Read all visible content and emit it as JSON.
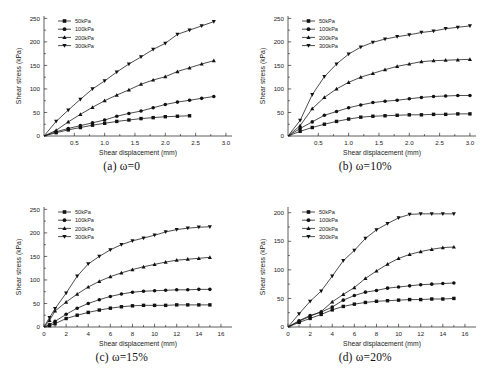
{
  "figure": {
    "background": "#ffffff",
    "series_color": "#111111",
    "panel_count": 4
  },
  "common": {
    "xlabel": "Shear displacement (mm)",
    "ylabel": "Shear stress (kPa)",
    "legend": [
      {
        "label": "50kPa",
        "marker": "square"
      },
      {
        "label": "100kPa",
        "marker": "circle"
      },
      {
        "label": "200kPa",
        "marker": "triangle-up"
      },
      {
        "label": "300kPa",
        "marker": "triangle-down"
      }
    ]
  },
  "captions": {
    "a": "(a) ω=0",
    "b": "(b) ω=10%",
    "c": "(c) ω=15%",
    "d": "(d) ω=20%"
  },
  "chart_data": [
    {
      "type": "line",
      "panel": "a",
      "title": "(a) ω=0",
      "xlabel": "Shear displacement (mm)",
      "ylabel": "Shear stress (kPa)",
      "xlim": [
        0,
        3.1
      ],
      "ylim": [
        0,
        255
      ],
      "xticks": [
        0.5,
        1.0,
        1.5,
        2.0,
        2.5,
        3.0
      ],
      "xticklabels": [
        "0.5",
        "1.0",
        "1.5",
        "2.0",
        "2.5",
        "3.0"
      ],
      "yticks": [
        0,
        50,
        100,
        150,
        200,
        250
      ],
      "yticklabels": [
        "0",
        "50",
        "100",
        "150",
        "200",
        "250"
      ],
      "grid": false,
      "legend_position": "top-left",
      "series": [
        {
          "name": "50kPa",
          "marker": "square",
          "x": [
            0,
            0.2,
            0.4,
            0.6,
            0.8,
            1.0,
            1.2,
            1.4,
            1.6,
            1.8,
            2.0,
            2.2,
            2.4
          ],
          "values": [
            0,
            7,
            13,
            18,
            23,
            27,
            31,
            34,
            37,
            39,
            41,
            42,
            43
          ]
        },
        {
          "name": "100kPa",
          "marker": "circle",
          "x": [
            0,
            0.2,
            0.4,
            0.6,
            0.8,
            1.0,
            1.2,
            1.4,
            1.6,
            1.8,
            2.0,
            2.2,
            2.4,
            2.6,
            2.8
          ],
          "values": [
            0,
            9,
            16,
            22,
            28,
            34,
            42,
            48,
            53,
            60,
            67,
            72,
            76,
            80,
            84
          ]
        },
        {
          "name": "200kPa",
          "marker": "triangle-up",
          "x": [
            0,
            0.2,
            0.4,
            0.6,
            0.8,
            1.0,
            1.2,
            1.4,
            1.6,
            1.8,
            2.0,
            2.2,
            2.4,
            2.6,
            2.8
          ],
          "values": [
            0,
            12,
            30,
            46,
            61,
            75,
            87,
            98,
            110,
            119,
            126,
            137,
            145,
            153,
            160
          ]
        },
        {
          "name": "300kPa",
          "marker": "triangle-down",
          "x": [
            0,
            0.2,
            0.4,
            0.6,
            0.8,
            1.0,
            1.2,
            1.4,
            1.6,
            1.8,
            2.0,
            2.2,
            2.4,
            2.6,
            2.8
          ],
          "values": [
            0,
            31,
            55,
            78,
            100,
            117,
            136,
            153,
            168,
            184,
            197,
            216,
            225,
            234,
            243
          ]
        }
      ]
    },
    {
      "type": "line",
      "panel": "b",
      "title": "(b) ω=10%",
      "xlabel": "Shear displacement (mm)",
      "ylabel": "Shear stress (kPa)",
      "xlim": [
        0,
        3.1
      ],
      "ylim": [
        0,
        255
      ],
      "xticks": [
        0.5,
        1.0,
        1.5,
        2.0,
        2.5,
        3.0
      ],
      "xticklabels": [
        "0.5",
        "1.0",
        "1.5",
        "2.0",
        "2.5",
        "3.0"
      ],
      "yticks": [
        0,
        50,
        100,
        150,
        200,
        250
      ],
      "yticklabels": [
        "0",
        "50",
        "100",
        "150",
        "200",
        "250"
      ],
      "grid": false,
      "legend_position": "top-left",
      "series": [
        {
          "name": "50kPa",
          "marker": "square",
          "x": [
            0,
            0.2,
            0.4,
            0.6,
            0.8,
            1.0,
            1.2,
            1.4,
            1.6,
            1.8,
            2.0,
            2.2,
            2.4,
            2.6,
            2.8,
            3.0
          ],
          "values": [
            0,
            10,
            18,
            25,
            31,
            36,
            40,
            42,
            43,
            44,
            45,
            45,
            46,
            46,
            47,
            47
          ]
        },
        {
          "name": "100kPa",
          "marker": "circle",
          "x": [
            0,
            0.2,
            0.4,
            0.6,
            0.8,
            1.0,
            1.2,
            1.4,
            1.6,
            1.8,
            2.0,
            2.2,
            2.4,
            2.6,
            2.8,
            3.0
          ],
          "values": [
            0,
            16,
            30,
            44,
            52,
            60,
            66,
            71,
            74,
            76,
            79,
            82,
            84,
            85,
            86,
            86
          ]
        },
        {
          "name": "200kPa",
          "marker": "triangle-up",
          "x": [
            0,
            0.2,
            0.4,
            0.6,
            0.8,
            1.0,
            1.2,
            1.4,
            1.6,
            1.8,
            2.0,
            2.2,
            2.4,
            2.6,
            2.8,
            3.0
          ],
          "values": [
            0,
            22,
            58,
            82,
            100,
            114,
            125,
            133,
            141,
            148,
            153,
            158,
            160,
            161,
            162,
            163
          ]
        },
        {
          "name": "300kPa",
          "marker": "triangle-down",
          "x": [
            0,
            0.2,
            0.4,
            0.6,
            0.8,
            1.0,
            1.2,
            1.4,
            1.6,
            1.8,
            2.0,
            2.2,
            2.4,
            2.6,
            2.8,
            3.0
          ],
          "values": [
            0,
            33,
            88,
            126,
            153,
            174,
            189,
            199,
            206,
            211,
            215,
            220,
            223,
            228,
            231,
            234
          ]
        }
      ]
    },
    {
      "type": "line",
      "panel": "c",
      "title": "(c) ω=15%",
      "xlabel": "Shear displacement (mm)",
      "ylabel": "Shear stress (kPa)",
      "xlim": [
        0,
        17
      ],
      "ylim": [
        0,
        255
      ],
      "xticks": [
        0,
        2,
        4,
        6,
        8,
        10,
        12,
        14,
        16
      ],
      "xticklabels": [
        "0",
        "2",
        "4",
        "6",
        "8",
        "10",
        "12",
        "14",
        "16"
      ],
      "yticks": [
        0,
        50,
        100,
        150,
        200,
        250
      ],
      "yticklabels": [
        "0",
        "50",
        "100",
        "150",
        "200",
        "250"
      ],
      "grid": false,
      "legend_position": "top-left",
      "series": [
        {
          "name": "50kPa",
          "marker": "square",
          "x": [
            0,
            0.5,
            1,
            2,
            3,
            4,
            5,
            6,
            7,
            8,
            9,
            10,
            11,
            12,
            13,
            14,
            15
          ],
          "values": [
            0,
            3,
            7,
            18,
            25,
            31,
            36,
            40,
            43,
            45,
            46,
            46,
            46,
            47,
            47,
            47,
            47
          ]
        },
        {
          "name": "100kPa",
          "marker": "circle",
          "x": [
            0,
            0.5,
            1,
            2,
            3,
            4,
            5,
            6,
            7,
            8,
            9,
            10,
            11,
            12,
            13,
            14,
            15
          ],
          "values": [
            0,
            5,
            12,
            27,
            40,
            50,
            58,
            65,
            70,
            74,
            76,
            77,
            78,
            79,
            79,
            80,
            80
          ]
        },
        {
          "name": "200kPa",
          "marker": "triangle-up",
          "x": [
            0,
            0.5,
            1,
            2,
            3,
            4,
            5,
            6,
            7,
            8,
            9,
            10,
            11,
            12,
            13,
            14,
            15
          ],
          "values": [
            0,
            14,
            34,
            53,
            70,
            85,
            97,
            107,
            115,
            122,
            128,
            133,
            138,
            142,
            144,
            146,
            148
          ]
        },
        {
          "name": "300kPa",
          "marker": "triangle-down",
          "x": [
            0,
            0.5,
            1,
            2,
            3,
            4,
            5,
            6,
            7,
            8,
            9,
            10,
            11,
            12,
            13,
            14,
            15
          ],
          "values": [
            0,
            20,
            39,
            72,
            108,
            134,
            150,
            164,
            175,
            183,
            189,
            195,
            202,
            207,
            210,
            212,
            213
          ]
        }
      ]
    },
    {
      "type": "line",
      "panel": "d",
      "title": "(d) ω=20%",
      "xlabel": "Shear displacement (mm)",
      "ylabel": "Shear stress (kPa)",
      "xlim": [
        0,
        17
      ],
      "ylim": [
        0,
        210
      ],
      "xticks": [
        0,
        2,
        4,
        6,
        8,
        10,
        12,
        14,
        16
      ],
      "xticklabels": [
        "0",
        "2",
        "4",
        "6",
        "8",
        "10",
        "12",
        "14",
        "16"
      ],
      "yticks": [
        0,
        50,
        100,
        150,
        200
      ],
      "yticklabels": [
        "0",
        "50",
        "100",
        "150",
        "200"
      ],
      "grid": false,
      "legend_position": "top-left",
      "series": [
        {
          "name": "50kPa",
          "marker": "square",
          "x": [
            0,
            1,
            2,
            3,
            4,
            5,
            6,
            7,
            8,
            9,
            10,
            11,
            12,
            13,
            14,
            15
          ],
          "values": [
            0,
            8,
            15,
            22,
            30,
            36,
            40,
            43,
            45,
            46,
            47,
            48,
            48,
            49,
            49,
            50
          ]
        },
        {
          "name": "100kPa",
          "marker": "circle",
          "x": [
            0,
            1,
            2,
            3,
            4,
            5,
            6,
            7,
            8,
            9,
            10,
            11,
            12,
            13,
            14,
            15
          ],
          "values": [
            0,
            11,
            20,
            26,
            35,
            47,
            55,
            61,
            64,
            68,
            70,
            72,
            74,
            75,
            76,
            77
          ]
        },
        {
          "name": "200kPa",
          "marker": "triangle-up",
          "x": [
            0,
            1,
            2,
            3,
            4,
            5,
            6,
            7,
            8,
            9,
            10,
            11,
            12,
            13,
            14,
            15
          ],
          "values": [
            0,
            10,
            19,
            27,
            44,
            57,
            69,
            85,
            98,
            110,
            120,
            127,
            132,
            136,
            139,
            140
          ]
        },
        {
          "name": "300kPa",
          "marker": "triangle-down",
          "x": [
            0,
            1,
            2,
            3,
            4,
            5,
            6,
            7,
            8,
            9,
            10,
            11,
            12,
            13,
            14,
            15
          ],
          "values": [
            0,
            23,
            45,
            63,
            89,
            116,
            134,
            155,
            170,
            181,
            191,
            197,
            198,
            198,
            198,
            198
          ]
        }
      ]
    }
  ]
}
